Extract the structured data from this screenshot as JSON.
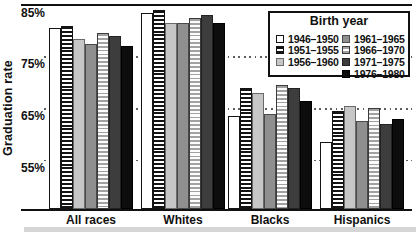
{
  "chart_data": {
    "type": "bar",
    "title": "",
    "ylabel": "Graduation rate",
    "xlabel": "",
    "categories": [
      "All races",
      "Whites",
      "Blacks",
      "Hispanics"
    ],
    "series": [
      {
        "name": "1946–1950",
        "fill": "white",
        "values": [
          80.5,
          83.5,
          63.5,
          58.5
        ]
      },
      {
        "name": "1951–1955",
        "fill": "stripe-dark",
        "values": [
          81.0,
          84.0,
          69.0,
          64.5
        ]
      },
      {
        "name": "1956–1960",
        "fill": "light-gray",
        "values": [
          78.5,
          81.5,
          68.0,
          65.5
        ]
      },
      {
        "name": "1961–1965",
        "fill": "medium-gray",
        "values": [
          77.5,
          81.5,
          64.0,
          62.5
        ]
      },
      {
        "name": "1966–1970",
        "fill": "stripe-light",
        "values": [
          79.5,
          82.5,
          69.5,
          65.0
        ]
      },
      {
        "name": "1971–1975",
        "fill": "dark-gray",
        "values": [
          79.0,
          83.0,
          69.0,
          62.0
        ]
      },
      {
        "name": "1976–1980",
        "fill": "black",
        "values": [
          77.0,
          81.5,
          66.5,
          63.0
        ]
      }
    ],
    "y_ticks": [
      {
        "label": "85%",
        "value": 85
      },
      {
        "label": "75%",
        "value": 75
      },
      {
        "label": "65%",
        "value": 65
      },
      {
        "label": "55%",
        "value": 55
      }
    ],
    "ylim": [
      45.5,
      85
    ],
    "grid": "dotted-horizontal",
    "legend": {
      "title": "Birth year",
      "position": "top-right",
      "columns": 2
    }
  },
  "colors": {
    "frame": "#111111",
    "grid_dot": "#5f5f5f",
    "white_fill": "#ffffff",
    "light_gray": "#c6c6c6",
    "medium_gray": "#8f8f8f",
    "dark_gray": "#3d3d3d",
    "black_fill": "#0d0d0d",
    "stripe_dark": "#141414",
    "stripe_light": "#a2a2a2",
    "bottom_band": "#d5d5d5"
  }
}
